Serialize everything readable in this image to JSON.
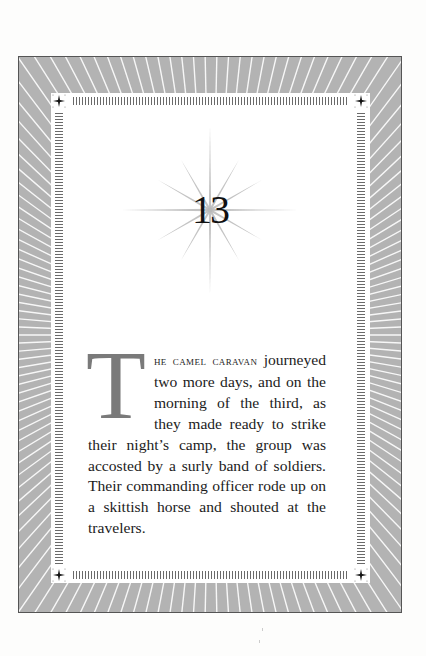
{
  "chapter": {
    "number": "13"
  },
  "body": {
    "drop_cap": "T",
    "lead_in": "he camel caravan",
    "text": " journeyed two more days, and on the morning of the third, as they made ready to strike their night’s camp, the group was accosted by a surly band of soldiers. Their commanding officer rode up on a skittish horse and shouted at the travelers."
  },
  "decor": {
    "frame_color": "#b3b3b3",
    "ray_color": "#ffffff",
    "tick_color": "#6a6a6a",
    "dropcap_color": "#7a7a7a",
    "icons": [
      "sunburst-frame",
      "corner-star-ornament",
      "chapter-starburst"
    ]
  }
}
